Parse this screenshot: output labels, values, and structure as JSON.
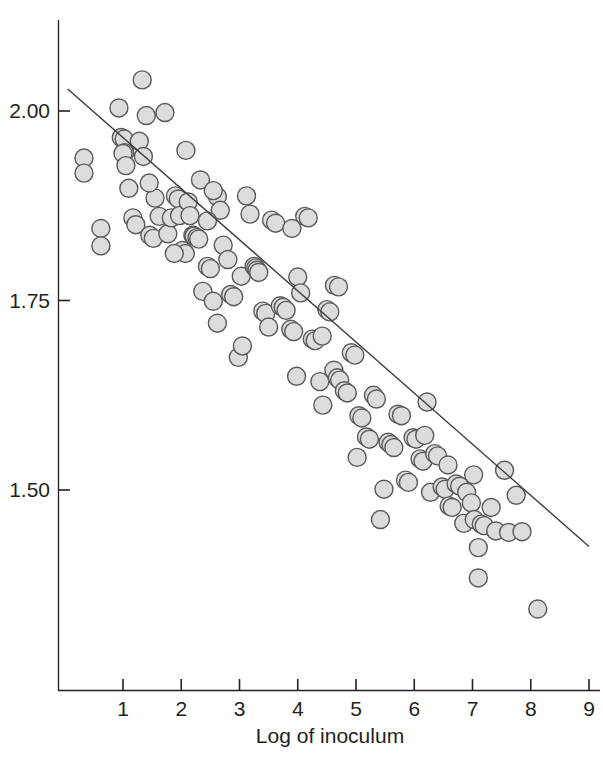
{
  "chart_data": {
    "type": "scatter",
    "title": "",
    "subtitle": "",
    "xlabel": "Log of inoculum",
    "ylabel": "",
    "xlim": [
      0,
      9.2
    ],
    "ylim": [
      1.375,
      2.055
    ],
    "xticks": [
      1,
      2,
      3,
      4,
      5,
      6,
      7,
      8,
      9
    ],
    "xticklabels": [
      "1",
      "2",
      "3",
      "4",
      "5",
      "6",
      "7",
      "8",
      "9"
    ],
    "yticks": [
      1.5,
      1.75,
      2.0
    ],
    "yticklabels": [
      "1.50",
      "1.75",
      "2.00"
    ],
    "grid": false,
    "legend": null,
    "marker": {
      "shape": "circle",
      "fill_color": "#dcdcdc",
      "edge_color": "#58595b",
      "diameter_px": 18,
      "edge_width_px": 1.4
    },
    "fit_line": {
      "type": "linear",
      "color": "#3b3b3b",
      "width_px": 1.4,
      "x_start": 0.05,
      "y_start": 2.029,
      "x_end": 9.0,
      "y_end": 1.4255,
      "slope": -0.0674,
      "intercept": 2.0324
    },
    "annotations": [],
    "points": [
      [
        0.33,
        1.938
      ],
      [
        0.33,
        1.918
      ],
      [
        0.62,
        1.845
      ],
      [
        0.62,
        1.822
      ],
      [
        0.93,
        2.004
      ],
      [
        0.97,
        1.965
      ],
      [
        1.02,
        1.963
      ],
      [
        1.03,
        1.945
      ],
      [
        1.0,
        1.944
      ],
      [
        1.05,
        1.928
      ],
      [
        1.1,
        1.898
      ],
      [
        1.17,
        1.859
      ],
      [
        1.22,
        1.85
      ],
      [
        1.33,
        2.041
      ],
      [
        1.4,
        1.994
      ],
      [
        1.46,
        1.836
      ],
      [
        1.52,
        1.832
      ],
      [
        1.55,
        1.885
      ],
      [
        1.62,
        1.861
      ],
      [
        1.72,
        1.998
      ],
      [
        1.77,
        1.838
      ],
      [
        1.83,
        1.859
      ],
      [
        1.9,
        1.888
      ],
      [
        1.95,
        1.884
      ],
      [
        1.97,
        1.862
      ],
      [
        2.02,
        1.816
      ],
      [
        2.07,
        1.812
      ],
      [
        2.12,
        1.88
      ],
      [
        2.15,
        1.862
      ],
      [
        2.2,
        1.836
      ],
      [
        2.22,
        1.835
      ],
      [
        2.27,
        1.833
      ],
      [
        2.3,
        1.831
      ],
      [
        2.33,
        1.909
      ],
      [
        2.37,
        1.762
      ],
      [
        2.45,
        1.795
      ],
      [
        2.5,
        1.792
      ],
      [
        2.55,
        1.749
      ],
      [
        2.62,
        1.887
      ],
      [
        2.67,
        1.869
      ],
      [
        2.72,
        1.823
      ],
      [
        2.8,
        1.804
      ],
      [
        2.85,
        1.758
      ],
      [
        2.9,
        1.755
      ],
      [
        2.98,
        1.675
      ],
      [
        3.03,
        1.782
      ],
      [
        3.12,
        1.888
      ],
      [
        3.18,
        1.864
      ],
      [
        3.25,
        1.795
      ],
      [
        3.28,
        1.793
      ],
      [
        3.3,
        1.79
      ],
      [
        3.33,
        1.787
      ],
      [
        3.4,
        1.736
      ],
      [
        3.45,
        1.733
      ],
      [
        3.5,
        1.715
      ],
      [
        3.55,
        1.856
      ],
      [
        3.62,
        1.852
      ],
      [
        3.7,
        1.743
      ],
      [
        3.75,
        1.741
      ],
      [
        3.8,
        1.737
      ],
      [
        3.88,
        1.712
      ],
      [
        3.93,
        1.709
      ],
      [
        4.0,
        1.781
      ],
      [
        4.05,
        1.76
      ],
      [
        4.12,
        1.861
      ],
      [
        4.18,
        1.859
      ],
      [
        4.25,
        1.699
      ],
      [
        4.3,
        1.697
      ],
      [
        4.38,
        1.643
      ],
      [
        4.43,
        1.612
      ],
      [
        4.5,
        1.738
      ],
      [
        4.55,
        1.735
      ],
      [
        4.62,
        1.658
      ],
      [
        4.68,
        1.648
      ],
      [
        4.72,
        1.645
      ],
      [
        4.8,
        1.631
      ],
      [
        4.85,
        1.628
      ],
      [
        4.92,
        1.681
      ],
      [
        4.98,
        1.678
      ],
      [
        5.05,
        1.598
      ],
      [
        5.1,
        1.595
      ],
      [
        5.18,
        1.57
      ],
      [
        5.23,
        1.567
      ],
      [
        5.3,
        1.625
      ],
      [
        5.35,
        1.62
      ],
      [
        5.42,
        1.461
      ],
      [
        5.48,
        1.501
      ],
      [
        5.55,
        1.563
      ],
      [
        5.6,
        1.56
      ],
      [
        5.65,
        1.556
      ],
      [
        5.72,
        1.6
      ],
      [
        5.78,
        1.598
      ],
      [
        5.85,
        1.513
      ],
      [
        5.9,
        1.51
      ],
      [
        5.98,
        1.569
      ],
      [
        6.03,
        1.567
      ],
      [
        6.1,
        1.541
      ],
      [
        6.15,
        1.538
      ],
      [
        6.22,
        1.616
      ],
      [
        6.28,
        1.497
      ],
      [
        6.35,
        1.548
      ],
      [
        6.4,
        1.545
      ],
      [
        6.48,
        1.504
      ],
      [
        6.53,
        1.501
      ],
      [
        6.6,
        1.479
      ],
      [
        6.65,
        1.477
      ],
      [
        6.72,
        1.508
      ],
      [
        6.78,
        1.505
      ],
      [
        6.85,
        1.456
      ],
      [
        6.9,
        1.497
      ],
      [
        6.98,
        1.483
      ],
      [
        7.03,
        1.461
      ],
      [
        7.1,
        1.424
      ],
      [
        7.15,
        1.455
      ],
      [
        7.2,
        1.453
      ],
      [
        7.32,
        1.477
      ],
      [
        7.4,
        1.446
      ],
      [
        7.55,
        1.526
      ],
      [
        7.62,
        1.444
      ],
      [
        7.75,
        1.493
      ],
      [
        7.85,
        1.445
      ],
      [
        7.1,
        1.384
      ],
      [
        8.12,
        1.343
      ],
      [
        4.63,
        1.77
      ],
      [
        4.7,
        1.768
      ],
      [
        2.55,
        1.895
      ],
      [
        3.9,
        1.845
      ],
      [
        1.28,
        1.96
      ],
      [
        1.35,
        1.94
      ],
      [
        2.08,
        1.948
      ],
      [
        1.45,
        1.905
      ],
      [
        5.02,
        1.543
      ],
      [
        4.42,
        1.703
      ],
      [
        6.18,
        1.572
      ],
      [
        3.98,
        1.65
      ],
      [
        2.62,
        1.72
      ],
      [
        3.05,
        1.69
      ],
      [
        1.88,
        1.812
      ],
      [
        2.45,
        1.855
      ],
      [
        6.58,
        1.533
      ],
      [
        7.02,
        1.52
      ]
    ]
  },
  "axes": {
    "x_axis_name": "x-axis",
    "y_axis_name": "y-axis"
  }
}
